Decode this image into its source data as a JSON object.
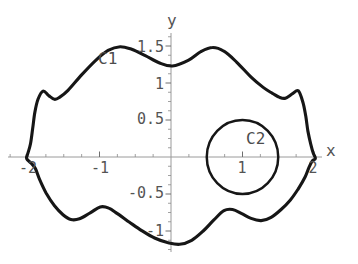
{
  "chart_data": {
    "type": "line",
    "title": "",
    "xlabel": "x",
    "ylabel": "y",
    "xlim": [
      -2.3,
      2.12
    ],
    "ylim": [
      -1.3,
      1.68
    ],
    "grid": false,
    "legend": "none",
    "x_tick_values": [
      -2,
      -1,
      1,
      2
    ],
    "x_tick_labels": [
      "-2",
      "-1",
      "1",
      "2"
    ],
    "x_minor_tick_step": 0.25,
    "y_tick_values": [
      -1,
      -0.5,
      0.5,
      1,
      1.5
    ],
    "y_tick_labels": [
      "-1",
      "-0.5",
      "0.5",
      "1",
      "1.5"
    ],
    "y_minor_tick_step": 0.125,
    "colors": {
      "background": "#ffffff",
      "curve": "#161616",
      "axis": "#9a9a9a",
      "major_tick": "#6e6e6e",
      "minor_tick": "#8a8a8a",
      "text": "#545454"
    },
    "series": [
      {
        "name": "C1",
        "kind": "closed-curve",
        "label": "C1",
        "label_data_xy": [
          -1.02,
          1.28
        ],
        "points": [
          [
            0.02,
            1.23
          ],
          [
            -0.16,
            1.27
          ],
          [
            -0.36,
            1.37
          ],
          [
            -0.55,
            1.455
          ],
          [
            -0.71,
            1.49
          ],
          [
            -0.88,
            1.44
          ],
          [
            -1.06,
            1.3
          ],
          [
            -1.25,
            1.11
          ],
          [
            -1.44,
            0.9
          ],
          [
            -1.56,
            0.805
          ],
          [
            -1.63,
            0.78
          ],
          [
            -1.71,
            0.83
          ],
          [
            -1.79,
            0.89
          ],
          [
            -1.86,
            0.78
          ],
          [
            -1.905,
            0.6
          ],
          [
            -1.935,
            0.38
          ],
          [
            -1.965,
            0.18
          ],
          [
            -2.0,
            0.055
          ],
          [
            -2.02,
            -0.02
          ],
          [
            -1.955,
            -0.085
          ],
          [
            -1.895,
            -0.16
          ],
          [
            -1.835,
            -0.31
          ],
          [
            -1.745,
            -0.49
          ],
          [
            -1.63,
            -0.66
          ],
          [
            -1.51,
            -0.78
          ],
          [
            -1.4,
            -0.845
          ],
          [
            -1.28,
            -0.835
          ],
          [
            -1.13,
            -0.755
          ],
          [
            -0.99,
            -0.675
          ],
          [
            -0.87,
            -0.69
          ],
          [
            -0.75,
            -0.765
          ],
          [
            -0.59,
            -0.875
          ],
          [
            -0.41,
            -0.995
          ],
          [
            -0.23,
            -1.095
          ],
          [
            -0.05,
            -1.155
          ],
          [
            0.12,
            -1.18
          ],
          [
            0.29,
            -1.125
          ],
          [
            0.45,
            -1.0
          ],
          [
            0.6,
            -0.85
          ],
          [
            0.74,
            -0.725
          ],
          [
            0.86,
            -0.71
          ],
          [
            0.99,
            -0.765
          ],
          [
            1.12,
            -0.83
          ],
          [
            1.26,
            -0.86
          ],
          [
            1.4,
            -0.815
          ],
          [
            1.54,
            -0.71
          ],
          [
            1.67,
            -0.58
          ],
          [
            1.78,
            -0.43
          ],
          [
            1.875,
            -0.27
          ],
          [
            1.93,
            -0.14
          ],
          [
            1.975,
            -0.055
          ],
          [
            2.02,
            -0.02
          ],
          [
            1.99,
            0.05
          ],
          [
            1.955,
            0.17
          ],
          [
            1.915,
            0.35
          ],
          [
            1.885,
            0.55
          ],
          [
            1.845,
            0.74
          ],
          [
            1.78,
            0.895
          ],
          [
            1.7,
            0.855
          ],
          [
            1.6,
            0.795
          ],
          [
            1.52,
            0.805
          ],
          [
            1.42,
            0.86
          ],
          [
            1.29,
            0.94
          ],
          [
            1.12,
            1.08
          ],
          [
            0.92,
            1.28
          ],
          [
            0.74,
            1.43
          ],
          [
            0.58,
            1.48
          ],
          [
            0.42,
            1.425
          ],
          [
            0.24,
            1.305
          ]
        ]
      },
      {
        "name": "C2",
        "kind": "circle",
        "label": "C2",
        "center": [
          1,
          0
        ],
        "radius": 0.5,
        "label_data_xy": [
          1.07,
          0.3
        ]
      }
    ]
  }
}
